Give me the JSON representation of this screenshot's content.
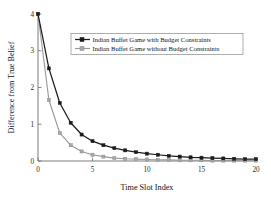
{
  "chart_data": {
    "type": "line",
    "title": "",
    "xlabel": "Time Slot Index",
    "ylabel": "Difference from True Belief",
    "xlim": [
      0,
      20
    ],
    "ylim": [
      0,
      4
    ],
    "xticks": [
      "0",
      "5",
      "10",
      "15",
      "20"
    ],
    "xtick_values": [
      0,
      5,
      10,
      15,
      20
    ],
    "yticks": [
      "0",
      "1",
      "2",
      "3",
      "4"
    ],
    "ytick_values": [
      0,
      1,
      2,
      3,
      4
    ],
    "grid": false,
    "legend_position": "upper center",
    "x": [
      0,
      1,
      2,
      3,
      4,
      5,
      6,
      7,
      8,
      9,
      10,
      11,
      12,
      13,
      14,
      15,
      16,
      17,
      18,
      19,
      20
    ],
    "series": [
      {
        "name": "Indian Buffet Game with Budget Constraints",
        "color": "#1b1b1b",
        "marker": "square-filled",
        "values": [
          4.0,
          2.52,
          1.58,
          1.04,
          0.72,
          0.54,
          0.43,
          0.35,
          0.29,
          0.24,
          0.2,
          0.17,
          0.14,
          0.12,
          0.1,
          0.09,
          0.08,
          0.07,
          0.06,
          0.05,
          0.05
        ]
      },
      {
        "name": "Indian Buffet Game without Budget Constraints",
        "color": "#9a9a9a",
        "marker": "square-open",
        "values": [
          4.0,
          1.66,
          0.76,
          0.43,
          0.26,
          0.17,
          0.12,
          0.08,
          0.06,
          0.05,
          0.04,
          0.03,
          0.03,
          0.02,
          0.02,
          0.02,
          0.01,
          0.01,
          0.01,
          0.01,
          0.01
        ]
      }
    ]
  },
  "legend": {
    "entries": [
      {
        "label": "Indian Buffet Game with Budget Constraints"
      },
      {
        "label": "Indian Buffet Game without Budget Constraints"
      }
    ]
  },
  "axes": {
    "x_title": "Time Slot Index",
    "y_title": "Difference from True Belief",
    "x_tick_labels": [
      "0",
      "5",
      "10",
      "15",
      "20"
    ],
    "y_tick_labels": [
      "0",
      "1",
      "2",
      "3",
      "4"
    ]
  }
}
